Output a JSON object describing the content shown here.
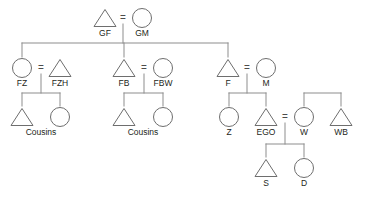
{
  "diagram": {
    "type": "genealogical-kinship-diagram",
    "colors": {
      "background": "#ffffff",
      "outline": "#6e6e6e",
      "link": "#8d8d8d",
      "label": "#231f20",
      "fill_none": "#ffffff",
      "fill_light": "#ececec",
      "fill_medium": "#a8a8a8"
    },
    "union_symbol": "=",
    "generations": [
      {
        "name": "generation-1-grandparents",
        "nodes": [
          {
            "id": "GF",
            "label": "GF",
            "shape": "triangle",
            "sex": "male",
            "fill": "light",
            "cx": 105,
            "cy": 18
          },
          {
            "id": "GM",
            "label": "GM",
            "shape": "circle",
            "sex": "female",
            "fill": "none",
            "cx": 142,
            "cy": 18
          }
        ]
      },
      {
        "name": "generation-2-parents",
        "nodes": [
          {
            "id": "FZ",
            "label": "FZ",
            "shape": "circle",
            "sex": "female",
            "fill": "light",
            "cx": 22,
            "cy": 68
          },
          {
            "id": "FZH",
            "label": "FZH",
            "shape": "triangle",
            "sex": "male",
            "fill": "none",
            "cx": 60,
            "cy": 68
          },
          {
            "id": "FB",
            "label": "FB",
            "shape": "triangle",
            "sex": "male",
            "fill": "light",
            "cx": 124,
            "cy": 68
          },
          {
            "id": "FBW",
            "label": "FBW",
            "shape": "circle",
            "sex": "female",
            "fill": "none",
            "cx": 163,
            "cy": 68
          },
          {
            "id": "F",
            "label": "F",
            "shape": "triangle",
            "sex": "male",
            "fill": "none",
            "cx": 228,
            "cy": 68
          },
          {
            "id": "M",
            "label": "M",
            "shape": "circle",
            "sex": "female",
            "fill": "none",
            "cx": 266,
            "cy": 68
          }
        ]
      },
      {
        "name": "generation-3-ego",
        "nodes": [
          {
            "id": "FZ-cousin-son",
            "label": "Cousins",
            "shape": "triangle",
            "sex": "male",
            "fill": "none",
            "cx": 22,
            "cy": 117
          },
          {
            "id": "FZ-cousin-daughter",
            "label": "",
            "shape": "circle",
            "sex": "female",
            "fill": "none",
            "cx": 60,
            "cy": 117
          },
          {
            "id": "FB-cousin-son",
            "label": "Cousins",
            "shape": "triangle",
            "sex": "male",
            "fill": "light",
            "cx": 124,
            "cy": 117
          },
          {
            "id": "FB-cousin-daughter",
            "label": "",
            "shape": "circle",
            "sex": "female",
            "fill": "light",
            "cx": 163,
            "cy": 117
          },
          {
            "id": "Z",
            "label": "Z",
            "shape": "circle",
            "sex": "female",
            "fill": "light",
            "cx": 229,
            "cy": 117
          },
          {
            "id": "EGO",
            "label": "EGO",
            "shape": "triangle",
            "sex": "male",
            "fill": "medium",
            "cx": 266,
            "cy": 117
          },
          {
            "id": "W",
            "label": "W",
            "shape": "circle",
            "sex": "female",
            "fill": "none",
            "cx": 304,
            "cy": 117
          },
          {
            "id": "WB",
            "label": "WB",
            "shape": "triangle",
            "sex": "male",
            "fill": "none",
            "cx": 341,
            "cy": 117
          }
        ]
      },
      {
        "name": "generation-4-children",
        "nodes": [
          {
            "id": "S",
            "label": "S",
            "shape": "triangle",
            "sex": "male",
            "fill": "light",
            "cx": 266,
            "cy": 168
          },
          {
            "id": "D",
            "label": "D",
            "shape": "circle",
            "sex": "female",
            "fill": "light",
            "cx": 304,
            "cy": 168
          }
        ]
      }
    ],
    "cousin_group_labels": [
      {
        "id": "cousins-left",
        "label": "Cousins",
        "x": 41,
        "y": 135
      },
      {
        "id": "cousins-middle",
        "label": "Cousins",
        "x": 143,
        "y": 135
      }
    ],
    "unions": [
      {
        "id": "union-GF-GM",
        "left": "GF",
        "right": "GM",
        "symbol": "=",
        "x": 123,
        "y": 21
      },
      {
        "id": "union-FZ-FZH",
        "left": "FZ",
        "right": "FZH",
        "symbol": "=",
        "x": 41,
        "y": 71
      },
      {
        "id": "union-FB-FBW",
        "left": "FB",
        "right": "FBW",
        "symbol": "=",
        "x": 144,
        "y": 71
      },
      {
        "id": "union-F-M",
        "left": "F",
        "right": "M",
        "symbol": "=",
        "x": 247,
        "y": 71
      },
      {
        "id": "union-EGO-W",
        "left": "EGO",
        "right": "W",
        "symbol": "=",
        "x": 285,
        "y": 120
      }
    ],
    "labels_flat": [
      "GF",
      "GM",
      "FZ",
      "FZH",
      "FB",
      "FBW",
      "F",
      "M",
      "Cousins",
      "Cousins",
      "Z",
      "EGO",
      "W",
      "WB",
      "S",
      "D"
    ]
  }
}
